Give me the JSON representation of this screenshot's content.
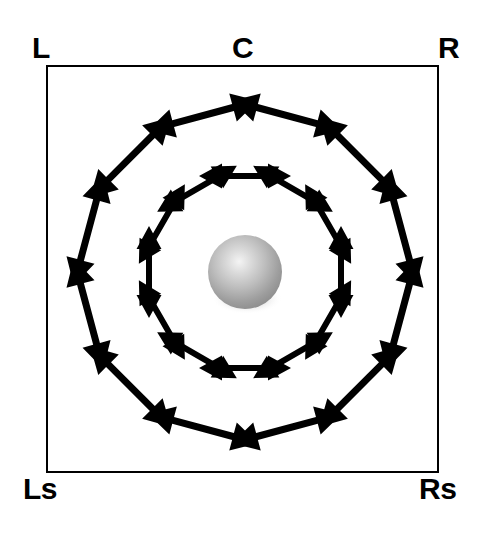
{
  "figure": {
    "background_color": "#ffffff",
    "stroke_color": "#000000"
  },
  "frame": {
    "name": "listening-area-frame",
    "x": 47,
    "y": 66,
    "width": 391,
    "height": 406,
    "border_width": 2,
    "border_color": "#000000",
    "fill_color": "#ffffff"
  },
  "labels": {
    "top_left": "L",
    "top_center": "C",
    "top_right": "R",
    "bottom_left": "Ls",
    "bottom_right": "Rs"
  },
  "center_sphere": {
    "name": "listener-sphere",
    "cx": 245,
    "cy": 272,
    "r": 37,
    "highlight_color": "#f2f2f2",
    "mid_color": "#b4b4b4",
    "edge_color": "#8a8a8a",
    "shadow_color": "#cfcfcf"
  },
  "arrow_rings": [
    {
      "name": "outer-arrow-ring",
      "count": 12,
      "radius": 162,
      "arrow_length": 114,
      "shaft_width": 7,
      "head_length": 26,
      "head_width": 29,
      "start_angle_deg": -75,
      "color": "#000000"
    },
    {
      "name": "inner-arrow-ring",
      "count": 12,
      "radius": 96,
      "arrow_length": 92,
      "shaft_width": 6,
      "head_length": 23,
      "head_width": 25,
      "start_angle_deg": -90,
      "color": "#000000"
    }
  ]
}
